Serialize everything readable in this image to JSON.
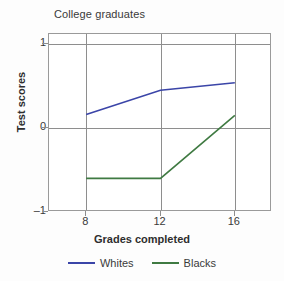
{
  "chart_data": {
    "type": "line",
    "title": "College graduates",
    "xlabel": "Grades completed",
    "ylabel": "Test scores",
    "x": [
      8,
      12,
      16
    ],
    "xticklabels": [
      "8",
      "12",
      "16"
    ],
    "yticks": [
      1,
      0,
      -1
    ],
    "yticklabels": [
      "1",
      "0",
      "–1"
    ],
    "xlim": [
      6,
      18
    ],
    "ylim": [
      -1,
      1.12
    ],
    "grid": true,
    "legend_position": "bottom",
    "series": [
      {
        "name": "Whites",
        "color": "#3b45a8",
        "values": [
          0.16,
          0.45,
          0.54
        ]
      },
      {
        "name": "Blacks",
        "color": "#3f7a42",
        "values": [
          -0.6,
          -0.6,
          0.15
        ]
      }
    ]
  },
  "legend": {
    "items": [
      {
        "label": "Whites",
        "color": "#3b45a8"
      },
      {
        "label": "Blacks",
        "color": "#3f7a42"
      }
    ]
  },
  "axis": {
    "y": {
      "label": "Test scores",
      "ticks": [
        "1",
        "0",
        "–1"
      ]
    },
    "x": {
      "label": "Grades completed",
      "ticks": [
        "8",
        "12",
        "16"
      ]
    }
  },
  "colors": {
    "whites_line": "#3b45a8",
    "blacks_line": "#3f7a42",
    "grid": "#8e8e8e",
    "frame": "#9a9a9a",
    "text": "#3a3a3a",
    "background": "#fdfdfd"
  }
}
